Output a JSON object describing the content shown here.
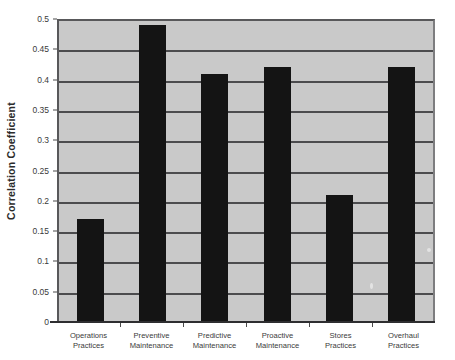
{
  "chart_data": {
    "type": "bar",
    "title": "",
    "xlabel": "",
    "ylabel": "Correlation Coefficient",
    "ylim": [
      0,
      0.5
    ],
    "ytick_step": 0.05,
    "grid": true,
    "legend": "none",
    "categories": [
      "Operations\nPractices",
      "Preventive\nMaintenance",
      "Predictive\nMaintenance",
      "Proactive\nMaintenance",
      "Stores\nPractices",
      "Overhaul\nPractices"
    ],
    "values": [
      0.17,
      0.49,
      0.41,
      0.42,
      0.21,
      0.42
    ],
    "ytick_labels": [
      "0.5",
      "0.45",
      "0.4",
      "0.35",
      "0.3",
      "0.25",
      "0.2",
      "0.15",
      "0.1",
      "0.05",
      "0"
    ],
    "ytick_values": [
      0.5,
      0.45,
      0.4,
      0.35,
      0.3,
      0.25,
      0.2,
      0.15,
      0.1,
      0.05,
      0
    ]
  },
  "style": {
    "bar_color": "#141414",
    "plot_background": "#c9c9c9",
    "gridline_color": "#4c4c4e",
    "axis_color": "#2e2e30",
    "text_color": "#3a3a3a",
    "page_background": "#ffffff"
  }
}
